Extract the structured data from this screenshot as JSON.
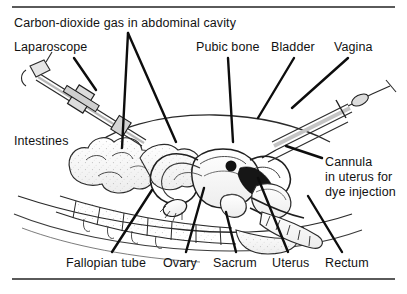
{
  "figure": {
    "background_color": "#ffffff",
    "rule_color": "#5a5a5a",
    "ink_color": "#121212"
  },
  "labels": {
    "carbon_dioxide": "Carbon-dioxide gas in abdominal cavity",
    "laparoscope": "Laparoscope",
    "pubic_bone": "Pubic bone",
    "bladder": "Bladder",
    "vagina": "Vagina",
    "intestines": "Intestines",
    "cannula_line1": "Cannula",
    "cannula_line2": "in uterus for",
    "cannula_line3": "dye injection",
    "fallopian_tube": "Fallopian tube",
    "ovary": "Ovary",
    "sacrum": "Sacrum",
    "uterus": "Uterus",
    "rectum": "Rectum"
  }
}
